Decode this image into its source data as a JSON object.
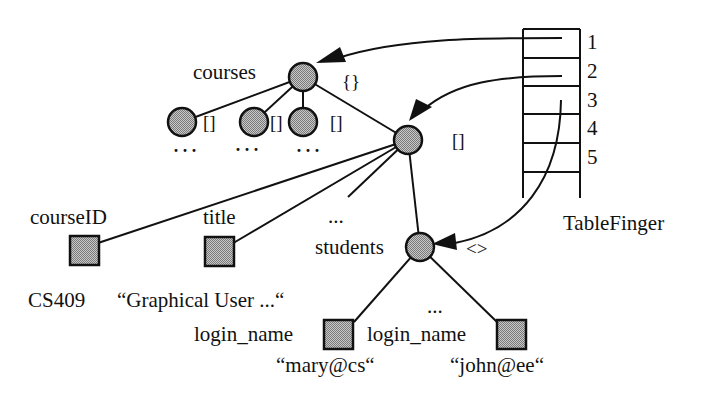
{
  "diagram": {
    "type": "tree-with-table-pointers",
    "root": {
      "label": "courses",
      "type_symbol": "{}"
    },
    "courses_children_type_symbol": "[]",
    "ellipsis": "...",
    "wide_ellipsis": "···",
    "list_node": {
      "type_symbol": "[]"
    },
    "fields": [
      {
        "label": "courseID",
        "value": "CS409"
      },
      {
        "label": "title",
        "value": "“Graphical User ...“"
      },
      {
        "label": "..."
      },
      {
        "label": "students",
        "type_symbol": "<>"
      }
    ],
    "students_children": [
      {
        "label": "login_name",
        "value": "“mary@cs“"
      },
      {
        "label": "login_name",
        "value": "“john@ee“"
      }
    ],
    "students_ellipsis": "...",
    "table": {
      "name": "TableFinger",
      "rows": [
        "1",
        "2",
        "3",
        "4",
        "5"
      ],
      "pointers": [
        {
          "row": "1",
          "target": "courses"
        },
        {
          "row": "2",
          "target": "list-node"
        },
        {
          "row": "3",
          "target": "students"
        }
      ]
    },
    "colors": {
      "node_fill": "#a9a9a9",
      "stroke": "#111111"
    }
  }
}
